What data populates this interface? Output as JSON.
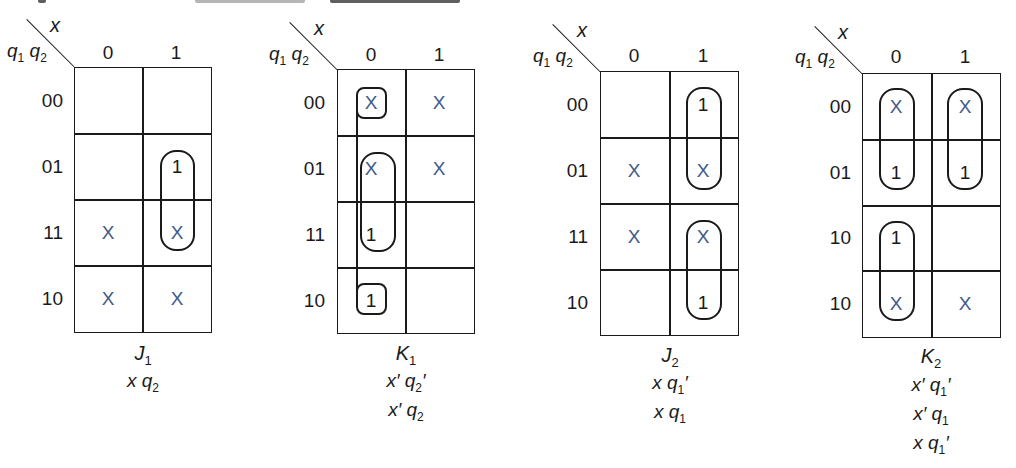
{
  "header_fragment": "cut-off heading text at top edge (illegible)",
  "colors": {
    "ink": "#1a1a1a",
    "dont_care": "#3f5a8a",
    "background": "#ffffff"
  },
  "maps": [
    {
      "id": "J1",
      "function_label": "J",
      "function_sub": "1",
      "col_var": "x",
      "row_vars": "q1 q2",
      "col_headers": [
        "0",
        "1"
      ],
      "row_headers": [
        "00",
        "01",
        "11",
        "10"
      ],
      "cells": [
        [
          "",
          ""
        ],
        [
          "",
          "1"
        ],
        [
          "X",
          "X"
        ],
        [
          "X",
          "X"
        ]
      ],
      "groups": [
        "rows 01-11, col 1"
      ],
      "expressions": [
        [
          "x",
          "q",
          "2",
          ""
        ]
      ]
    },
    {
      "id": "K1",
      "function_label": "K",
      "function_sub": "1",
      "col_var": "x",
      "row_vars": "q1 q2",
      "col_headers": [
        "0",
        "1"
      ],
      "row_headers": [
        "00",
        "01",
        "11",
        "10"
      ],
      "cells": [
        [
          "X",
          "X"
        ],
        [
          "X",
          "X"
        ],
        [
          "1",
          ""
        ],
        [
          "1",
          ""
        ]
      ],
      "groups": [
        "rows 00+10 wrap-around, col 0",
        "rows 01-11, col 0"
      ],
      "expressions": [
        [
          "x'",
          "q",
          "2",
          "'"
        ],
        [
          "x'",
          "q",
          "2",
          ""
        ]
      ]
    },
    {
      "id": "J2",
      "function_label": "J",
      "function_sub": "2",
      "col_var": "x",
      "row_vars": "q1 q2",
      "col_headers": [
        "0",
        "1"
      ],
      "row_headers": [
        "00",
        "01",
        "11",
        "10"
      ],
      "cells": [
        [
          "",
          "1"
        ],
        [
          "X",
          "X"
        ],
        [
          "X",
          "X"
        ],
        [
          "",
          "1"
        ]
      ],
      "groups": [
        "rows 00-01, col 1",
        "rows 11-10, col 1"
      ],
      "expressions": [
        [
          "x",
          "q",
          "1",
          "'"
        ],
        [
          "x",
          "q",
          "1",
          ""
        ]
      ]
    },
    {
      "id": "K2",
      "function_label": "K",
      "function_sub": "2",
      "col_var": "x",
      "row_vars": "q1 q2",
      "col_headers": [
        "0",
        "1"
      ],
      "row_headers": [
        "00",
        "01",
        "10",
        "10"
      ],
      "cells": [
        [
          "X",
          "X"
        ],
        [
          "1",
          "1"
        ],
        [
          "1",
          ""
        ],
        [
          "X",
          "X"
        ]
      ],
      "groups": [
        "rows 00-01, col 0",
        "rows 00-01, col 1",
        "rows 3-4, col 0"
      ],
      "expressions": [
        [
          "x'",
          "q",
          "1",
          "'"
        ],
        [
          "x'",
          "q",
          "1",
          ""
        ],
        [
          "x",
          "q",
          "1",
          "'"
        ]
      ]
    }
  ]
}
